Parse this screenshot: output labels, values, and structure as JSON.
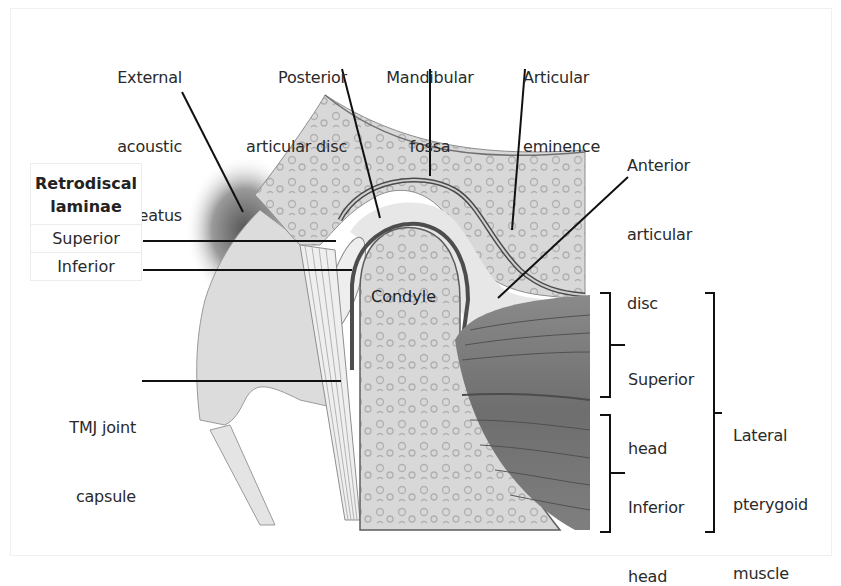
{
  "figure": {
    "colors": {
      "background": "#ffffff",
      "bone": "#d9d9d9",
      "bone_pattern": "#b5b5b5",
      "cartilage": "#e8e8e8",
      "muscle": "#7a7a7a",
      "leader_line": "#111111",
      "label_text": "#2a2a2a"
    }
  },
  "labels": {
    "external_acoustic_meatus": [
      "External",
      "acoustic",
      "meatus"
    ],
    "posterior_articular_disc": [
      "Posterior",
      "articular disc"
    ],
    "mandibular_fossa": [
      "Mandibular",
      "fossa"
    ],
    "articular_eminence": [
      "Articular",
      "eminence"
    ],
    "anterior_articular_disc": [
      "Anterior",
      "articular",
      "disc"
    ],
    "condyle": "Condyle",
    "tmj_joint_capsule": [
      "TMJ joint",
      "capsule"
    ],
    "superior_head": [
      "Superior",
      "head"
    ],
    "inferior_head": [
      "Inferior",
      "head"
    ],
    "lateral_pterygoid_muscle": [
      "Lateral",
      "pterygoid",
      "muscle"
    ]
  },
  "legend": {
    "title": [
      "Retrodiscal",
      "laminae"
    ],
    "rows": [
      "Superior",
      "Inferior"
    ]
  }
}
